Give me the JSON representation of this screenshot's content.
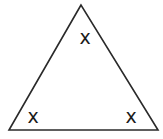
{
  "diagram": {
    "type": "triangle",
    "vertices": {
      "top": [
        81,
        5
      ],
      "bottom_left": [
        9,
        130
      ],
      "bottom_right": [
        158,
        130
      ]
    },
    "stroke_color": "#2a2a2a",
    "angle_labels": [
      {
        "position": "top",
        "text": "x"
      },
      {
        "position": "bottom-left",
        "text": "x"
      },
      {
        "position": "bottom-right",
        "text": "x"
      }
    ]
  }
}
